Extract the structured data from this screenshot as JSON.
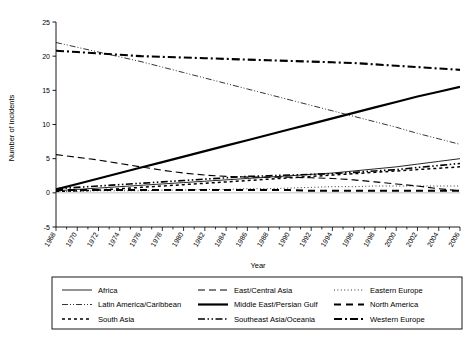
{
  "chart_data": {
    "type": "line",
    "title": "",
    "xlabel": "Year",
    "ylabel": "Number of incidents",
    "xlim": [
      1968,
      2006
    ],
    "ylim": [
      -5,
      25
    ],
    "yticks": [
      -5,
      0,
      5,
      10,
      15,
      20,
      25
    ],
    "grid": false,
    "legend_position": "bottom",
    "legend_columns": 3,
    "x": [
      1968,
      1970,
      1972,
      1974,
      1976,
      1978,
      1980,
      1982,
      1984,
      1986,
      1988,
      1990,
      1992,
      1994,
      1996,
      1998,
      2000,
      2002,
      2004,
      2006
    ],
    "categories": [
      "1968",
      "1970",
      "1972",
      "1974",
      "1976",
      "1978",
      "1980",
      "1982",
      "1984",
      "1986",
      "1988",
      "1990",
      "1992",
      "1994",
      "1996",
      "1998",
      "2000",
      "2002",
      "2004",
      "2006"
    ],
    "series": [
      {
        "name": "Africa",
        "style": "solid-thin",
        "values": [
          0.3,
          0.5,
          0.7,
          0.9,
          1.1,
          1.3,
          1.5,
          1.7,
          1.9,
          2.1,
          2.3,
          2.5,
          2.7,
          2.9,
          3.2,
          3.5,
          3.8,
          4.2,
          4.6,
          5.0
        ]
      },
      {
        "name": "East/Central Asia",
        "style": "long-dash",
        "values": [
          5.6,
          5.2,
          4.8,
          4.3,
          3.8,
          3.3,
          2.9,
          2.6,
          2.4,
          2.3,
          2.3,
          2.3,
          2.2,
          2.1,
          1.9,
          1.6,
          1.3,
          1.0,
          0.6,
          0.3
        ]
      },
      {
        "name": "Eastern Europe",
        "style": "dotted",
        "values": [
          0.2,
          0.2,
          0.3,
          0.3,
          0.3,
          0.4,
          0.4,
          0.5,
          0.5,
          0.6,
          0.6,
          0.7,
          0.8,
          0.9,
          0.9,
          1.0,
          1.0,
          1.0,
          1.0,
          1.0
        ]
      },
      {
        "name": "Latin America/Caribbean",
        "style": "thin-dash-dot-dot",
        "values": [
          22.0,
          21.3,
          20.6,
          19.9,
          19.2,
          18.4,
          17.6,
          16.8,
          16.0,
          15.2,
          14.4,
          13.6,
          12.8,
          12.0,
          11.2,
          10.4,
          9.6,
          8.7,
          7.9,
          7.1
        ]
      },
      {
        "name": "Middle East/Persian Gulf",
        "style": "solid-thick",
        "values": [
          0.5,
          1.3,
          2.1,
          2.9,
          3.7,
          4.5,
          5.3,
          6.1,
          6.9,
          7.7,
          8.5,
          9.3,
          10.1,
          10.9,
          11.7,
          12.5,
          13.3,
          14.1,
          14.8,
          15.5
        ]
      },
      {
        "name": "North America",
        "style": "thick-dash",
        "values": [
          0.4,
          0.4,
          0.4,
          0.4,
          0.4,
          0.4,
          0.4,
          0.4,
          0.4,
          0.4,
          0.4,
          0.4,
          0.3,
          0.3,
          0.3,
          0.3,
          0.3,
          0.3,
          0.3,
          0.3
        ]
      },
      {
        "name": "South Asia",
        "style": "short-dash",
        "values": [
          0.2,
          0.3,
          0.4,
          0.6,
          0.8,
          1.0,
          1.2,
          1.4,
          1.6,
          1.8,
          2.0,
          2.2,
          2.4,
          2.6,
          2.8,
          3.0,
          3.2,
          3.4,
          3.6,
          3.8
        ]
      },
      {
        "name": "Southeast Asia/Oceania",
        "style": "dash-dot-dot",
        "values": [
          0.6,
          0.8,
          1.0,
          1.2,
          1.4,
          1.6,
          1.8,
          2.0,
          2.2,
          2.4,
          2.5,
          2.6,
          2.7,
          2.8,
          3.0,
          3.2,
          3.4,
          3.7,
          4.0,
          4.3
        ]
      },
      {
        "name": "Western Europe",
        "style": "thick-dash-dot",
        "values": [
          20.8,
          20.6,
          20.4,
          20.2,
          20.0,
          19.9,
          19.8,
          19.7,
          19.6,
          19.5,
          19.4,
          19.3,
          19.2,
          19.1,
          19.0,
          18.8,
          18.6,
          18.4,
          18.2,
          18.0
        ]
      }
    ],
    "legend": [
      {
        "label": "Africa",
        "style": "solid-thin"
      },
      {
        "label": "East/Central Asia",
        "style": "long-dash"
      },
      {
        "label": "Eastern Europe",
        "style": "dotted"
      },
      {
        "label": "Latin America/Caribbean",
        "style": "thin-dash-dot-dot"
      },
      {
        "label": "Middle East/Persian Gulf",
        "style": "solid-thick"
      },
      {
        "label": "North America",
        "style": "thick-dash"
      },
      {
        "label": "South Asia",
        "style": "short-dash"
      },
      {
        "label": "Southeast Asia/Oceania",
        "style": "dash-dot-dot"
      },
      {
        "label": "Western Europe",
        "style": "thick-dash-dot"
      }
    ]
  }
}
